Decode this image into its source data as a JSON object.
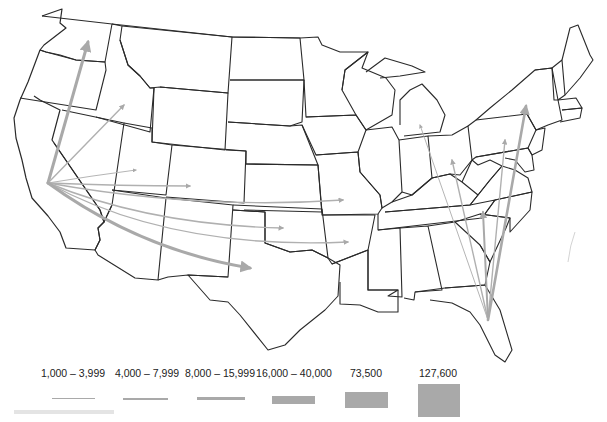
{
  "map": {
    "region": "Contiguous United States",
    "outline_color": "#2a2a2a",
    "flow_color": "#a9a9a9",
    "origins": [
      {
        "name": "California",
        "x": 48,
        "y": 183
      },
      {
        "name": "Florida",
        "x": 488,
        "y": 320
      }
    ],
    "flows": [
      {
        "from": "California",
        "to": "Washington",
        "class": 4
      },
      {
        "from": "California",
        "to": "Idaho",
        "class": 2
      },
      {
        "from": "California",
        "to": "Utah",
        "class": 1
      },
      {
        "from": "California",
        "to": "Colorado",
        "class": 2
      },
      {
        "from": "California",
        "to": "Missouri",
        "class": 2
      },
      {
        "from": "California",
        "to": "Oklahoma",
        "class": 2
      },
      {
        "from": "California",
        "to": "Arkansas",
        "class": 2
      },
      {
        "from": "California",
        "to": "Texas",
        "class": 4
      },
      {
        "from": "Florida",
        "to": "Michigan",
        "class": 1
      },
      {
        "from": "Florida",
        "to": "Ohio",
        "class": 1
      },
      {
        "from": "Florida",
        "to": "Pennsylvania",
        "class": 2
      },
      {
        "from": "Florida",
        "to": "New York",
        "class": 4
      },
      {
        "from": "Florida",
        "to": "North Carolina",
        "class": 3
      }
    ]
  },
  "legend": {
    "items": [
      {
        "label": "1,000 – 3,999"
      },
      {
        "label": "4,000 – 7,999"
      },
      {
        "label": "8,000 – 15,999"
      },
      {
        "label": "16,000 – 40,000"
      },
      {
        "label": "73,500"
      },
      {
        "label": "127,600"
      }
    ]
  }
}
